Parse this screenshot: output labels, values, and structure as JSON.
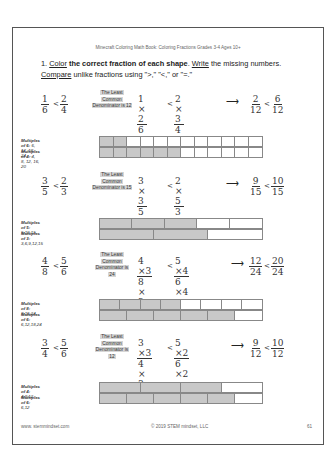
{
  "header": "Minecraft Coloring Math Book: Coloring Fractions Grades 3-4 Ages 10+",
  "instructions": {
    "number": "1.",
    "line1_parts": [
      "Color",
      "the correct fraction of each shape",
      "Write",
      "the missing numbers."
    ],
    "line2_parts": [
      "Compare",
      "unlike fractions using \">,\" \"<,\" or \"=.\""
    ]
  },
  "problems": [
    {
      "left": {
        "a_num": "1",
        "a_den": "6",
        "op": "<",
        "b_num": "2",
        "b_den": "4"
      },
      "lcd": [
        "The Least",
        "Common",
        "Denominator is 12"
      ],
      "expand": {
        "a_num": "1 × 2",
        "a_den": "6 × 2",
        "op": "<",
        "b_num": "2 × 3",
        "b_den": "4 × 3"
      },
      "result": {
        "a_num": "2",
        "a_den": "12",
        "op": "<",
        "b_num": "6",
        "b_den": "12"
      },
      "multiples": [
        {
          "label": "Multiples of 6:",
          "values": "6, 12, 18, 24, ..."
        },
        {
          "label": "Multiples of 4:",
          "values": "4, 8, 12, 16, 20"
        }
      ],
      "bars": [
        {
          "parts": 12,
          "filled": 2
        },
        {
          "parts": 12,
          "filled": 6
        }
      ]
    },
    {
      "left": {
        "a_num": "3",
        "a_den": "5",
        "op": "<",
        "b_num": "2",
        "b_den": "3"
      },
      "lcd": [
        "The Least",
        "Common",
        "Denominator is 15"
      ],
      "expand": {
        "a_num": "3 × 3",
        "a_den": "5 × 3",
        "op": "<",
        "b_num": "2 × 5",
        "b_den": "3 × 5"
      },
      "result": {
        "a_num": "9",
        "a_den": "15",
        "op": "<",
        "b_num": "10",
        "b_den": "15"
      },
      "multiples": [
        {
          "label": "Multiples of 5:",
          "values": "5,10,15"
        },
        {
          "label": "Multiples of 3:",
          "values": "3,6,9,12,15"
        }
      ],
      "bars": [
        {
          "parts": 5,
          "filled": 3
        },
        {
          "parts": 3,
          "filled": 2
        }
      ]
    },
    {
      "left": {
        "a_num": "4",
        "a_den": "8",
        "op": "<",
        "b_num": "5",
        "b_den": "6"
      },
      "lcd": [
        "The Least",
        "Common",
        "Denominator is",
        "24"
      ],
      "expand": {
        "a_num": "4 ×3",
        "a_den": "8 × 3",
        "op": "<",
        "b_num": "5 ×4",
        "b_den": "6 ×4"
      },
      "result": {
        "a_num": "12",
        "a_den": "24",
        "op": "<",
        "b_num": "20",
        "b_den": "24"
      },
      "multiples": [
        {
          "label": "Multiples of 8:",
          "values": "8,16,24"
        },
        {
          "label": "Multiples of 6:",
          "values": "6,12,18,24"
        }
      ],
      "bars": [
        {
          "parts": 8,
          "filled": 4
        },
        {
          "parts": 6,
          "filled": 5
        }
      ]
    },
    {
      "left": {
        "a_num": "3",
        "a_den": "4",
        "op": "<",
        "b_num": "5",
        "b_den": "6"
      },
      "lcd": [
        "The Least",
        "Common",
        "Denominator is",
        "12"
      ],
      "expand": {
        "a_num": "3 ×3",
        "a_den": "4 × 3",
        "op": "<",
        "b_num": "5 ×2",
        "b_den": "6 ×2"
      },
      "result": {
        "a_num": "9",
        "a_den": "12",
        "op": "<",
        "b_num": "10",
        "b_den": "12"
      },
      "multiples": [
        {
          "label": "Multiples of 4:",
          "values": "4,8,12"
        },
        {
          "label": "Multiples of 6:",
          "values": "6,12"
        }
      ],
      "bars": [
        {
          "parts": 4,
          "filled": 3
        },
        {
          "parts": 6,
          "filled": 5
        }
      ]
    }
  ],
  "arrow": "⟶",
  "footer": {
    "website": "www. stemmindset.com",
    "copyright": "© 2019 STEM mindset, LLC",
    "page": "61"
  },
  "colors": {
    "fill": "#c8c8c8",
    "highlight": "#d6d6d6",
    "border": "#555555"
  }
}
